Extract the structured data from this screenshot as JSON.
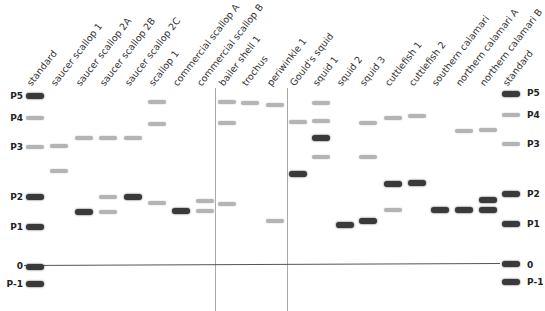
{
  "figure": {
    "type": "electrophoresis-gel-diagram",
    "baseline_label": "0",
    "position_labels": [
      "P5",
      "P4",
      "P3",
      "P2",
      "P1",
      "0",
      "P-1"
    ],
    "lanes": [
      {
        "label": "standard",
        "x": 35
      },
      {
        "label": "saucer scallop 1",
        "x": 59
      },
      {
        "label": "saucer scallop 2A",
        "x": 84
      },
      {
        "label": "saucer scallop 2B",
        "x": 108
      },
      {
        "label": "saucer scallop 2C",
        "x": 133
      },
      {
        "label": "scallop 1",
        "x": 157
      },
      {
        "label": "commercial scallop A",
        "x": 181
      },
      {
        "label": "commercial scallop B",
        "x": 205
      },
      {
        "label": "bailer shell 1",
        "x": 227
      },
      {
        "label": "trochus",
        "x": 250
      },
      {
        "label": "periwinkle 1",
        "x": 275
      },
      {
        "label": "Gould's squid",
        "x": 298
      },
      {
        "label": "squid 1",
        "x": 321
      },
      {
        "label": "squid 2",
        "x": 345
      },
      {
        "label": "squid 3",
        "x": 368
      },
      {
        "label": "cuttlefish 1",
        "x": 393
      },
      {
        "label": "cuttlefish 2",
        "x": 417
      },
      {
        "label": "southern calamari",
        "x": 440
      },
      {
        "label": "northern calamari A",
        "x": 464
      },
      {
        "label": "northern calamari B",
        "x": 488
      },
      {
        "label": "standard",
        "x": 511
      }
    ],
    "bands": [
      {
        "lane": 0,
        "y": 96,
        "tone": "dark"
      },
      {
        "lane": 0,
        "y": 118,
        "tone": "light"
      },
      {
        "lane": 0,
        "y": 147,
        "tone": "light"
      },
      {
        "lane": 0,
        "y": 197,
        "tone": "dark"
      },
      {
        "lane": 0,
        "y": 227,
        "tone": "dark"
      },
      {
        "lane": 0,
        "y": 267,
        "tone": "dark"
      },
      {
        "lane": 0,
        "y": 284,
        "tone": "dark"
      },
      {
        "lane": 1,
        "y": 146,
        "tone": "light"
      },
      {
        "lane": 1,
        "y": 171,
        "tone": "light"
      },
      {
        "lane": 2,
        "y": 138,
        "tone": "light"
      },
      {
        "lane": 2,
        "y": 212,
        "tone": "dark"
      },
      {
        "lane": 3,
        "y": 138,
        "tone": "light"
      },
      {
        "lane": 3,
        "y": 197,
        "tone": "light"
      },
      {
        "lane": 3,
        "y": 212,
        "tone": "light"
      },
      {
        "lane": 4,
        "y": 138,
        "tone": "light"
      },
      {
        "lane": 4,
        "y": 197,
        "tone": "dark"
      },
      {
        "lane": 5,
        "y": 102,
        "tone": "light"
      },
      {
        "lane": 5,
        "y": 124,
        "tone": "light"
      },
      {
        "lane": 5,
        "y": 203,
        "tone": "light"
      },
      {
        "lane": 6,
        "y": 211,
        "tone": "dark"
      },
      {
        "lane": 7,
        "y": 201,
        "tone": "light"
      },
      {
        "lane": 7,
        "y": 211,
        "tone": "light"
      },
      {
        "lane": 8,
        "y": 102,
        "tone": "light"
      },
      {
        "lane": 8,
        "y": 123,
        "tone": "light"
      },
      {
        "lane": 8,
        "y": 204,
        "tone": "light"
      },
      {
        "lane": 9,
        "y": 103,
        "tone": "light"
      },
      {
        "lane": 10,
        "y": 105,
        "tone": "light"
      },
      {
        "lane": 10,
        "y": 221,
        "tone": "light"
      },
      {
        "lane": 11,
        "y": 122,
        "tone": "light"
      },
      {
        "lane": 11,
        "y": 174,
        "tone": "dark"
      },
      {
        "lane": 12,
        "y": 103,
        "tone": "light"
      },
      {
        "lane": 12,
        "y": 121,
        "tone": "light"
      },
      {
        "lane": 12,
        "y": 138,
        "tone": "dark"
      },
      {
        "lane": 12,
        "y": 157,
        "tone": "light"
      },
      {
        "lane": 13,
        "y": 225,
        "tone": "dark"
      },
      {
        "lane": 14,
        "y": 123,
        "tone": "light"
      },
      {
        "lane": 14,
        "y": 157,
        "tone": "light"
      },
      {
        "lane": 14,
        "y": 221,
        "tone": "dark"
      },
      {
        "lane": 15,
        "y": 118,
        "tone": "light"
      },
      {
        "lane": 15,
        "y": 184,
        "tone": "dark"
      },
      {
        "lane": 15,
        "y": 210,
        "tone": "light"
      },
      {
        "lane": 16,
        "y": 116,
        "tone": "light"
      },
      {
        "lane": 16,
        "y": 183,
        "tone": "dark"
      },
      {
        "lane": 17,
        "y": 210,
        "tone": "dark"
      },
      {
        "lane": 18,
        "y": 131,
        "tone": "light"
      },
      {
        "lane": 18,
        "y": 210,
        "tone": "dark"
      },
      {
        "lane": 19,
        "y": 130,
        "tone": "light"
      },
      {
        "lane": 19,
        "y": 200,
        "tone": "dark"
      },
      {
        "lane": 19,
        "y": 210,
        "tone": "dark"
      },
      {
        "lane": 20,
        "y": 94,
        "tone": "dark"
      },
      {
        "lane": 20,
        "y": 115,
        "tone": "light"
      },
      {
        "lane": 20,
        "y": 144,
        "tone": "light"
      },
      {
        "lane": 20,
        "y": 194,
        "tone": "dark"
      },
      {
        "lane": 20,
        "y": 224,
        "tone": "dark"
      },
      {
        "lane": 20,
        "y": 264,
        "tone": "dark"
      },
      {
        "lane": 20,
        "y": 282,
        "tone": "dark"
      }
    ],
    "left_markers": [
      {
        "label": "P5",
        "y": 96
      },
      {
        "label": "P4",
        "y": 118
      },
      {
        "label": "P3",
        "y": 147
      },
      {
        "label": "P2",
        "y": 197
      },
      {
        "label": "P1",
        "y": 227
      },
      {
        "label": "0",
        "y": 266
      },
      {
        "label": "P-1",
        "y": 284
      }
    ],
    "right_markers": [
      {
        "label": "P5",
        "y": 93
      },
      {
        "label": "P4",
        "y": 115
      },
      {
        "label": "P3",
        "y": 144
      },
      {
        "label": "P2",
        "y": 194
      },
      {
        "label": "P1",
        "y": 224
      },
      {
        "label": "0",
        "y": 265
      },
      {
        "label": "P-1",
        "y": 282
      }
    ],
    "dividers": [
      {
        "x": 215
      },
      {
        "x": 287
      }
    ],
    "baseline": {
      "x1": 24,
      "x2": 500,
      "y1": 265,
      "y2": 263
    },
    "colors": {
      "dark": "#3a3a3a",
      "light": "#b4b4b4",
      "divider": "#a8a8a8",
      "baseline": "#555555"
    }
  }
}
